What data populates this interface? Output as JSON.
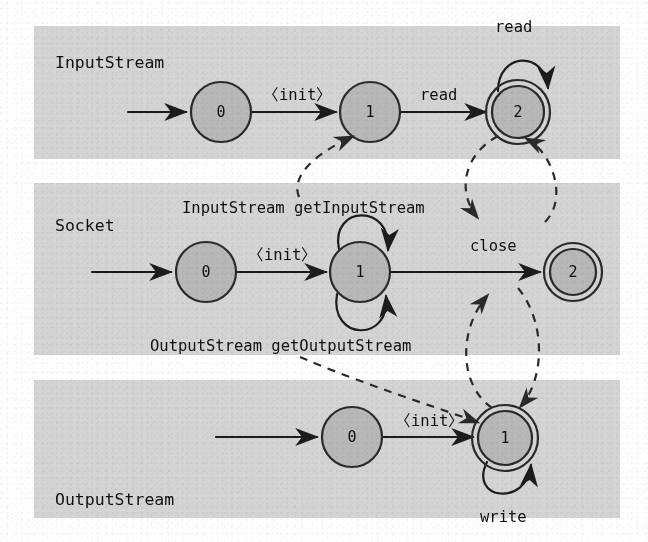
{
  "figure": {
    "kind": "state-machine-diagram",
    "colors": {
      "band_background": "#d4d4d4",
      "state_fill": "#b8b8b8",
      "stroke": "#1c1c1c",
      "page_background": "#ffffff"
    }
  },
  "bands": [
    {
      "id": "inputstream",
      "title": "InputStream",
      "title_pos": {
        "x": 55,
        "y": 68
      }
    },
    {
      "id": "socket",
      "title": "Socket",
      "title_pos": {
        "x": 55,
        "y": 231
      }
    },
    {
      "id": "outputstream",
      "title": "OutputStream",
      "title_pos": {
        "x": 55,
        "y": 505
      }
    }
  ],
  "automata": [
    {
      "id": "inputstream",
      "name": "InputStream",
      "states": [
        {
          "id": "is0",
          "label": "0",
          "cx": 221,
          "cy": 112,
          "r": 30,
          "accepting": false
        },
        {
          "id": "is1",
          "label": "1",
          "cx": 370,
          "cy": 112,
          "r": 30,
          "accepting": false
        },
        {
          "id": "is2",
          "label": "2",
          "cx": 518,
          "cy": 112,
          "r": 27,
          "accepting": true
        }
      ],
      "transitions": [
        {
          "from": "start",
          "to": "is0",
          "label": ""
        },
        {
          "from": "is0",
          "to": "is1",
          "label": "〈init〉",
          "label_pos": {
            "x": 263,
            "y": 100
          }
        },
        {
          "from": "is1",
          "to": "is2",
          "label": "read",
          "label_pos": {
            "x": 420,
            "y": 100
          }
        },
        {
          "from": "is2",
          "to": "is2",
          "label": "read",
          "label_pos": {
            "x": 495,
            "y": 32
          },
          "self_loop": "top"
        }
      ]
    },
    {
      "id": "socket",
      "name": "Socket",
      "states": [
        {
          "id": "so0",
          "label": "0",
          "cx": 206,
          "cy": 272,
          "r": 30,
          "accepting": false
        },
        {
          "id": "so1",
          "label": "1",
          "cx": 360,
          "cy": 272,
          "r": 30,
          "accepting": false
        },
        {
          "id": "so2",
          "label": "2",
          "cx": 573,
          "cy": 272,
          "r": 24,
          "accepting": true
        }
      ],
      "transitions": [
        {
          "from": "start",
          "to": "so0",
          "label": ""
        },
        {
          "from": "so0",
          "to": "so1",
          "label": "〈init〉",
          "label_pos": {
            "x": 248,
            "y": 260
          }
        },
        {
          "from": "so1",
          "to": "so1",
          "label": "InputStream getInputStream",
          "label_pos": {
            "x": 182,
            "y": 213
          },
          "self_loop": "top"
        },
        {
          "from": "so1",
          "to": "so1",
          "label": "OutputStream getOutputStream",
          "label_pos": {
            "x": 150,
            "y": 351
          },
          "self_loop": "bottom"
        },
        {
          "from": "so1",
          "to": "so2",
          "label": "close",
          "label_pos": {
            "x": 470,
            "y": 251
          }
        }
      ]
    },
    {
      "id": "outputstream",
      "name": "OutputStream",
      "states": [
        {
          "id": "os0",
          "label": "0",
          "cx": 352,
          "cy": 437,
          "r": 30,
          "accepting": false
        },
        {
          "id": "os1",
          "label": "1",
          "cx": 505,
          "cy": 438,
          "r": 27,
          "accepting": true
        }
      ],
      "transitions": [
        {
          "from": "start",
          "to": "os0",
          "label": ""
        },
        {
          "from": "os0",
          "to": "os1",
          "label": "〈init〉",
          "label_pos": {
            "x": 395,
            "y": 426
          }
        },
        {
          "from": "os1",
          "to": "os1",
          "label": "write",
          "label_pos": {
            "x": 480,
            "y": 522
          },
          "self_loop": "bottom"
        }
      ]
    }
  ],
  "cross_edges": [
    {
      "id": "getinputstream-creates",
      "from": "socket.getInputStream",
      "to": "inputstream.state1",
      "style": "dashed"
    },
    {
      "id": "inputstream-close-down",
      "from": "inputstream.state2",
      "to": "socket.close",
      "style": "dashed"
    },
    {
      "id": "inputstream-close-up",
      "from": "socket.close",
      "to": "inputstream.state2",
      "style": "dashed"
    },
    {
      "id": "getoutputstream-creates",
      "from": "socket.getOutputStream",
      "to": "outputstream.state1",
      "style": "dashed"
    },
    {
      "id": "socket-close-up",
      "from": "outputstream.state1",
      "to": "socket.close",
      "style": "dashed"
    },
    {
      "id": "socket-close-down",
      "from": "socket.close",
      "to": "outputstream.state1",
      "style": "dashed"
    }
  ]
}
